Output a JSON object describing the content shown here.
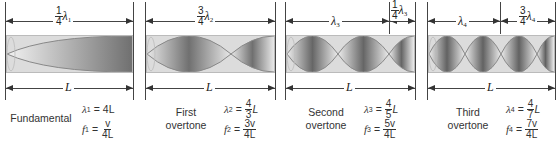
{
  "colors": {
    "line": "#444444",
    "tube_light": "#e2e2e2",
    "tube_dark": "#6a6a6a",
    "node_curve": "#888888"
  },
  "panels": [
    {
      "name_line1": "Fundamental",
      "name_line2": "",
      "top_segments": [
        {
          "num": "1",
          "den": "4",
          "sym": "λ",
          "sub": "1"
        }
      ],
      "bottom_label": "L",
      "lambda": {
        "sym": "λ",
        "sub": "1",
        "op": "=",
        "value": "4L"
      },
      "freq": {
        "sym": "f",
        "sub": "1",
        "op": "=",
        "num": "v",
        "den": "4L"
      },
      "quarter_waves": 1
    },
    {
      "name_line1": "First",
      "name_line2": "overtone",
      "top_segments": [
        {
          "num": "3",
          "den": "4",
          "sym": "λ",
          "sub": "2"
        }
      ],
      "bottom_label": "L",
      "lambda": {
        "sym": "λ",
        "sub": "2",
        "op": "=",
        "num": "4",
        "den": "3",
        "suffix": "L"
      },
      "freq": {
        "sym": "f",
        "sub": "2",
        "op": "=",
        "num": "3v",
        "den": "4L"
      },
      "quarter_waves": 3
    },
    {
      "name_line1": "Second",
      "name_line2": "overtone",
      "top_segments": [
        {
          "sym": "λ",
          "sub": "3"
        },
        {
          "num": "1",
          "den": "4",
          "sym": "λ",
          "sub": "3"
        }
      ],
      "bottom_label": "L",
      "lambda": {
        "sym": "λ",
        "sub": "3",
        "op": "=",
        "num": "4",
        "den": "5",
        "suffix": "L"
      },
      "freq": {
        "sym": "f",
        "sub": "3",
        "op": "=",
        "num": "5v",
        "den": "4L"
      },
      "quarter_waves": 5
    },
    {
      "name_line1": "Third",
      "name_line2": "overtone",
      "top_segments": [
        {
          "sym": "λ",
          "sub": "4"
        },
        {
          "num": "3",
          "den": "4",
          "sym": "λ",
          "sub": "4"
        }
      ],
      "bottom_label": "L",
      "lambda": {
        "sym": "λ",
        "sub": "4",
        "op": "=",
        "num": "4",
        "den": "7",
        "suffix": "L"
      },
      "freq": {
        "sym": "f",
        "sub": "4",
        "op": "=",
        "num": "7v",
        "den": "4L"
      },
      "quarter_waves": 7
    }
  ]
}
